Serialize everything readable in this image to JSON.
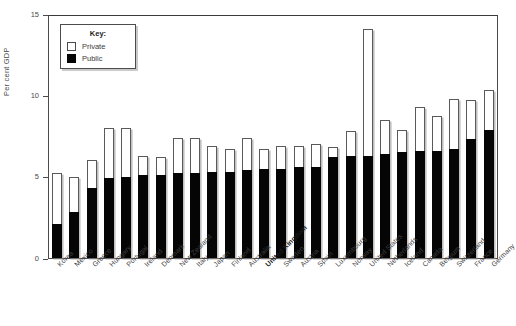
{
  "chart": {
    "ylabel": "Per cent GDP",
    "y_ticks": [
      "0",
      "5",
      "10",
      "15"
    ],
    "legend": {
      "title": "Key:",
      "items": [
        {
          "label": "Private",
          "color": "#ffffff"
        },
        {
          "label": "Public",
          "color": "#050505"
        }
      ]
    }
  },
  "chart_data": {
    "type": "bar",
    "subtype": "stacked",
    "title": "",
    "xlabel": "",
    "ylabel": "Per cent GDP",
    "ylim": [
      0,
      15
    ],
    "yticks": [
      0,
      5,
      10,
      15
    ],
    "grid": false,
    "legend_position": "top-left",
    "highlight_category": "United Kingdom",
    "categories": [
      "Korea",
      "Mexico",
      "Greece",
      "Hungary",
      "Portugal",
      "Ireland",
      "Denmark",
      "New Zealand",
      "Italy",
      "Japan",
      "Finland",
      "Australia",
      "United Kingdom",
      "Sweden",
      "Austria",
      "Spain",
      "Luxembourg",
      "Norway",
      "United States",
      "Netherlands",
      "Iceland",
      "Canada",
      "Belgium",
      "Switzerland",
      "France",
      "Germany"
    ],
    "series": [
      {
        "name": "Public",
        "color": "#050505",
        "values": [
          2.1,
          2.8,
          4.3,
          4.9,
          5.0,
          5.1,
          5.1,
          5.2,
          5.2,
          5.3,
          5.3,
          5.4,
          5.5,
          5.5,
          5.6,
          5.6,
          6.2,
          6.3,
          6.3,
          6.4,
          6.5,
          6.6,
          6.6,
          6.7,
          7.3,
          7.9
        ]
      },
      {
        "name": "Private",
        "color": "#ffffff",
        "values": [
          3.1,
          2.2,
          1.7,
          3.1,
          3.0,
          1.2,
          1.1,
          2.2,
          2.2,
          1.6,
          1.4,
          2.0,
          1.2,
          1.4,
          1.3,
          1.4,
          0.6,
          1.5,
          7.8,
          2.1,
          1.4,
          2.7,
          2.1,
          3.1,
          2.4,
          2.4
        ]
      }
    ],
    "totals": [
      5.2,
      5.0,
      6.0,
      8.0,
      8.0,
      6.3,
      6.2,
      7.4,
      7.4,
      6.9,
      6.7,
      7.4,
      6.7,
      6.9,
      6.9,
      7.0,
      6.8,
      7.8,
      14.1,
      8.5,
      7.9,
      9.3,
      8.7,
      9.8,
      9.7,
      10.3
    ]
  }
}
